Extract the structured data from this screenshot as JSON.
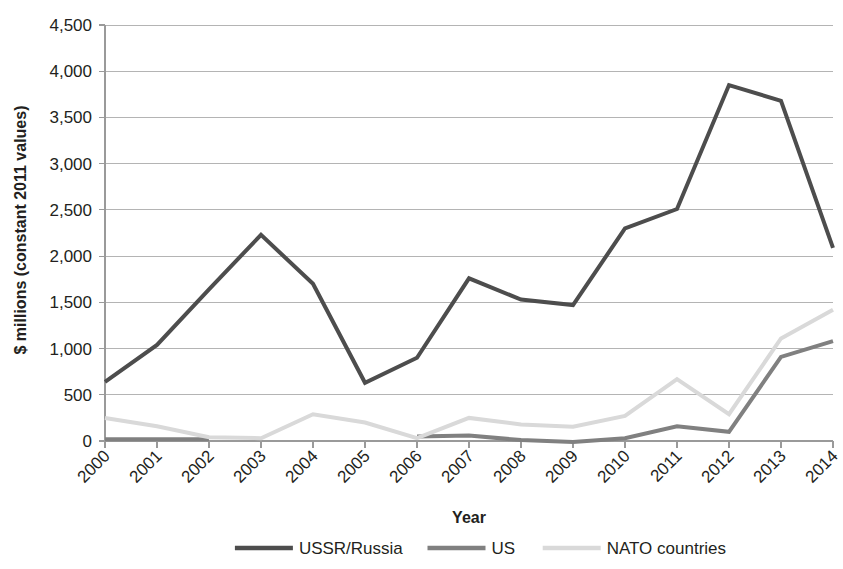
{
  "chart_data": {
    "type": "line",
    "title": "",
    "xlabel": "Year",
    "ylabel": "$ millions (constant 2011 values)",
    "categories": [
      "2000",
      "2001",
      "2002",
      "2003",
      "2004",
      "2005",
      "2006",
      "2007",
      "2008",
      "2009",
      "2010",
      "2011",
      "2012",
      "2013",
      "2014"
    ],
    "x": [
      2000,
      2001,
      2002,
      2003,
      2004,
      2005,
      2006,
      2007,
      2008,
      2009,
      2010,
      2011,
      2012,
      2013,
      2014
    ],
    "ylim": [
      0,
      4500
    ],
    "ytick_values": [
      0,
      500,
      1000,
      1500,
      2000,
      2500,
      3000,
      3500,
      4000,
      4500
    ],
    "ytick_labels": [
      "0",
      "500",
      "1,000",
      "1,500",
      "2,000",
      "2,500",
      "3,000",
      "3,500",
      "4,000",
      "4,500"
    ],
    "grid": true,
    "legend_position": "bottom",
    "series": [
      {
        "name": "USSR/Russia",
        "color": "#4d4d4d",
        "width": 4,
        "values": [
          640,
          1040,
          1640,
          2230,
          1700,
          630,
          900,
          1760,
          1530,
          1470,
          2300,
          2510,
          3850,
          3680,
          2090
        ]
      },
      {
        "name": "US",
        "color": "#808080",
        "width": 4,
        "values": [
          20,
          20,
          20,
          null,
          null,
          null,
          50,
          60,
          10,
          -10,
          30,
          160,
          100,
          910,
          1080
        ]
      },
      {
        "name": "NATO countries",
        "color": "#d9d9d9",
        "width": 4,
        "values": [
          250,
          160,
          40,
          30,
          290,
          200,
          30,
          250,
          180,
          155,
          270,
          670,
          290,
          1110,
          1420
        ]
      }
    ]
  },
  "legend": {
    "items": [
      {
        "label": "USSR/Russia",
        "color": "#4d4d4d"
      },
      {
        "label": "US",
        "color": "#808080"
      },
      {
        "label": "NATO countries",
        "color": "#d9d9d9"
      }
    ]
  }
}
